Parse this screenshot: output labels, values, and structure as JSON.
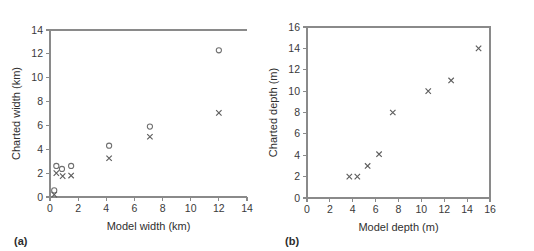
{
  "figure": {
    "panel_a_tag": "(a)",
    "panel_b_tag": "(b)"
  },
  "chart_data": [
    {
      "type": "scatter",
      "panel": "(a)",
      "title": "",
      "xlabel": "Model width (km)",
      "ylabel": "Charted width (km)",
      "xlim": [
        0,
        14
      ],
      "ylim": [
        0,
        14
      ],
      "xticks": [
        0,
        2,
        4,
        6,
        8,
        10,
        12,
        14
      ],
      "xtick_labels": [
        "0",
        "2",
        "4",
        "6",
        "8",
        "10",
        "12",
        "14"
      ],
      "yticks": [
        0,
        2,
        4,
        6,
        8,
        10,
        12,
        14
      ],
      "ytick_labels": [
        "0",
        "2",
        "4",
        "6",
        "8",
        "10",
        "12",
        "14"
      ],
      "grid": false,
      "legend": "none",
      "frame": "top-left-spines",
      "series": [
        {
          "name": "open-circle",
          "marker": "circle",
          "points": [
            [
              0.3,
              0.55
            ],
            [
              0.45,
              2.6
            ],
            [
              0.85,
              2.35
            ],
            [
              1.5,
              2.6
            ],
            [
              4.2,
              4.3
            ],
            [
              7.1,
              5.9
            ],
            [
              12.0,
              12.3
            ]
          ]
        },
        {
          "name": "cross",
          "marker": "x",
          "points": [
            [
              0.3,
              0.2
            ],
            [
              0.45,
              2.0
            ],
            [
              0.9,
              1.75
            ],
            [
              1.5,
              1.8
            ],
            [
              4.2,
              3.25
            ],
            [
              7.1,
              5.05
            ],
            [
              12.0,
              7.05
            ]
          ]
        }
      ]
    },
    {
      "type": "scatter",
      "panel": "(b)",
      "title": "",
      "xlabel": "Model depth (m)",
      "ylabel": "Charted depth (m)",
      "xlim": [
        0,
        16
      ],
      "ylim": [
        0,
        16
      ],
      "xticks": [
        0,
        2,
        4,
        6,
        8,
        10,
        12,
        14,
        16
      ],
      "xtick_labels": [
        "0",
        "2",
        "4",
        "6",
        "8",
        "10",
        "12",
        "14",
        "16"
      ],
      "yticks": [
        0,
        2,
        4,
        6,
        8,
        10,
        12,
        14,
        16
      ],
      "ytick_labels": [
        "0",
        "2",
        "4",
        "6",
        "8",
        "10",
        "12",
        "14",
        "16"
      ],
      "grid": false,
      "legend": "none",
      "frame": "full-box",
      "series": [
        {
          "name": "cross",
          "marker": "x",
          "points": [
            [
              3.7,
              2.0
            ],
            [
              4.4,
              2.0
            ],
            [
              5.3,
              3.0
            ],
            [
              6.3,
              4.1
            ],
            [
              7.5,
              8.0
            ],
            [
              10.6,
              10.0
            ],
            [
              12.6,
              11.0
            ],
            [
              15.0,
              14.0
            ]
          ]
        }
      ]
    }
  ]
}
